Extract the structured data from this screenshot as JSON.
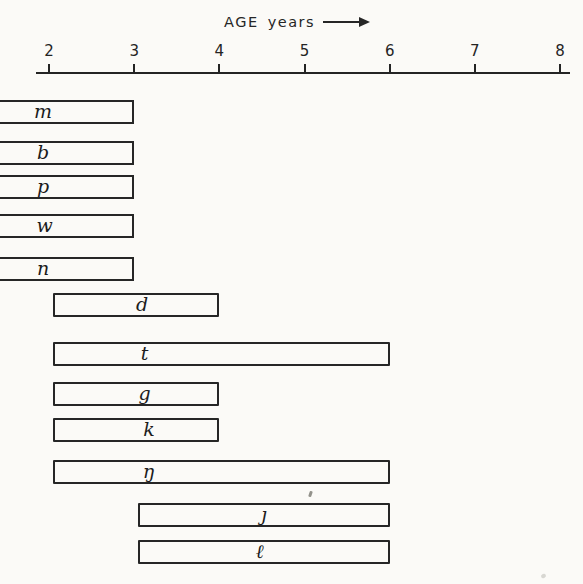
{
  "header": {
    "label": "AGE years"
  },
  "chart_data": {
    "type": "bar",
    "subtype": "horizontal-age-range",
    "title": "AGE years",
    "xlabel": "AGE years",
    "ylabel": "consonant speech sounds",
    "xlim": [
      2,
      8
    ],
    "x_ticks": [
      2,
      3,
      4,
      5,
      6,
      7,
      8
    ],
    "grid": false,
    "legend": false,
    "open_left_meaning": "bar runs off the left edge of the figure, i.e. range begins before age 2",
    "bars": [
      {
        "sound": "m",
        "glyph": "m",
        "start": null,
        "end": 3,
        "open_left": true,
        "label_age": 1.93
      },
      {
        "sound": "b",
        "glyph": "b",
        "start": null,
        "end": 3,
        "open_left": true,
        "label_age": 1.93
      },
      {
        "sound": "p",
        "glyph": "p",
        "start": null,
        "end": 3,
        "open_left": true,
        "label_age": 1.93
      },
      {
        "sound": "w",
        "glyph": "w",
        "start": null,
        "end": 3,
        "open_left": true,
        "label_age": 1.95
      },
      {
        "sound": "n",
        "glyph": "n",
        "start": null,
        "end": 3,
        "open_left": true,
        "label_age": 1.93
      },
      {
        "sound": "d",
        "glyph": "d",
        "start": 2,
        "end": 4,
        "open_left": false,
        "label_age": 3.07
      },
      {
        "sound": "t",
        "glyph": "t",
        "start": 2,
        "end": 6,
        "open_left": false,
        "label_age": 3.1
      },
      {
        "sound": "g",
        "glyph": "g",
        "start": 2,
        "end": 4,
        "open_left": false,
        "label_age": 3.1
      },
      {
        "sound": "k",
        "glyph": "k",
        "start": 2,
        "end": 4,
        "open_left": false,
        "label_age": 3.15
      },
      {
        "sound": "ŋ",
        "glyph": "ŋ",
        "start": 2,
        "end": 6,
        "open_left": false,
        "label_age": 3.15
      },
      {
        "sound": "j",
        "glyph": "ȷ",
        "start": 3,
        "end": 6,
        "open_left": false,
        "label_age": 4.5
      },
      {
        "sound": "l",
        "glyph": "ℓ",
        "start": 3,
        "end": 6,
        "open_left": false,
        "label_age": 4.45
      }
    ]
  },
  "colors": {
    "ink": "#262626",
    "paper": "#fbfaf7"
  }
}
